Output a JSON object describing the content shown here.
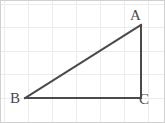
{
  "figure": {
    "name": "right-triangle-abc",
    "width": 165,
    "height": 123,
    "background_color": "#ffffff",
    "border_color": "#d0d0d0",
    "grid": {
      "visible": true,
      "color": "#ececec",
      "spacing": 24,
      "vertical_lines": [
        4,
        28,
        52,
        76,
        100,
        124,
        148
      ],
      "horizontal_lines": [
        4,
        27,
        51,
        74,
        98
      ]
    },
    "triangle": {
      "stroke_color": "#4a4a4a",
      "stroke_width": 2,
      "fill": "none",
      "vertices": [
        {
          "label": "A",
          "x": 141,
          "y": 25,
          "label_x": 130,
          "label_y": 8
        },
        {
          "label": "B",
          "x": 25,
          "y": 98,
          "label_x": 10,
          "label_y": 91
        },
        {
          "label": "C",
          "x": 141,
          "y": 98,
          "label_x": 139,
          "label_y": 92
        }
      ],
      "sides": [
        {
          "name": "hypotenuse-BA",
          "from": "B",
          "to": "A"
        },
        {
          "name": "base-BC",
          "from": "B",
          "to": "C"
        },
        {
          "name": "vertical-CA",
          "from": "C",
          "to": "A"
        }
      ],
      "right_angle_at": "C"
    },
    "labels": {
      "a": "A",
      "b": "B",
      "c": "C"
    }
  }
}
